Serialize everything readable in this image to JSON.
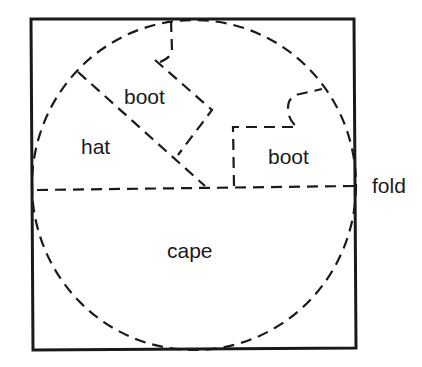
{
  "diagram": {
    "type": "cloth-cutting-pattern",
    "colors": {
      "ink": "#1a1a1a",
      "background": "#ffffff"
    },
    "square": {
      "corners": [
        [
          31,
          19
        ],
        [
          354,
          19
        ],
        [
          356,
          348
        ],
        [
          33,
          350
        ]
      ]
    },
    "circle": {
      "cx": 194,
      "cy": 185,
      "rx": 162,
      "ry": 165,
      "style": "dashed"
    },
    "fold_line": {
      "from": [
        37,
        190
      ],
      "to": [
        355,
        186
      ],
      "style": "dashed"
    },
    "regions": [
      {
        "id": "hat",
        "label": "hat",
        "x": 81,
        "y": 154
      },
      {
        "id": "boot-1",
        "label": "boot",
        "x": 124,
        "y": 104
      },
      {
        "id": "boot-2",
        "label": "boot",
        "x": 268,
        "y": 164
      },
      {
        "id": "cape",
        "label": "cape",
        "x": 167,
        "y": 258
      }
    ],
    "external_labels": [
      {
        "id": "fold",
        "label": "fold",
        "x": 372,
        "y": 193
      }
    ]
  }
}
